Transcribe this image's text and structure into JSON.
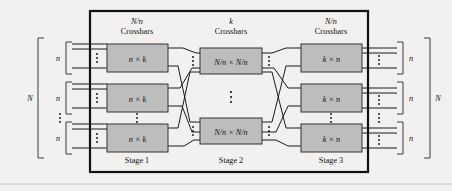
{
  "figure": {
    "background_color": "#f2f1ef",
    "crossbar_fill": "#bdbdbd",
    "line_color": "#1b1b1b"
  },
  "headers": [
    {
      "count_label": "N/n",
      "kind_label": "Crossbars",
      "x": 137
    },
    {
      "count_label": "k",
      "kind_label": "Crossbars",
      "x": 231
    },
    {
      "count_label": "N/n",
      "kind_label": "Crossbars",
      "x": 331
    }
  ],
  "stages": [
    {
      "name": "Stage 1",
      "label_x": 137,
      "box_label": "n × k",
      "boxes": [
        {
          "x": 107,
          "y": 44,
          "w": 61,
          "h": 28,
          "label": "n × k"
        },
        {
          "x": 107,
          "y": 84,
          "w": 61,
          "h": 28,
          "label": "n × k"
        },
        {
          "x": 107,
          "y": 124,
          "w": 61,
          "h": 28,
          "label": "n × k"
        }
      ],
      "vertical_ellipsis": [
        {
          "x": 137,
          "y": 114
        }
      ]
    },
    {
      "name": "Stage 2",
      "label_x": 231,
      "box_label": "N/n × N/n",
      "boxes": [
        {
          "x": 200,
          "y": 48,
          "w": 62,
          "h": 26,
          "label": "N/n × N/n"
        },
        {
          "x": 200,
          "y": 118,
          "w": 62,
          "h": 26,
          "label": "N/n × N/n"
        }
      ],
      "vertical_ellipsis": [
        {
          "x": 231,
          "y": 96
        }
      ]
    },
    {
      "name": "Stage 3",
      "label_x": 331,
      "box_label": "k × n",
      "boxes": [
        {
          "x": 301,
          "y": 44,
          "w": 61,
          "h": 28,
          "label": "k × n"
        },
        {
          "x": 301,
          "y": 84,
          "w": 61,
          "h": 28,
          "label": "k × n"
        },
        {
          "x": 301,
          "y": 124,
          "w": 61,
          "h": 28,
          "label": "k × n"
        }
      ],
      "vertical_ellipsis": [
        {
          "x": 331,
          "y": 114
        }
      ]
    }
  ],
  "left_brackets": {
    "outer_label": "N",
    "group_label": "n",
    "groups": [
      {
        "label": "n",
        "y_top": 42,
        "y_bottom": 74
      },
      {
        "label": "n",
        "y_top": 82,
        "y_bottom": 114
      },
      {
        "label": "n",
        "y_top": 122,
        "y_bottom": 154
      }
    ],
    "between_groups_ellipsis": [
      {
        "x": 60,
        "y": 118
      }
    ]
  },
  "right_brackets": {
    "outer_label": "N",
    "group_label": "n",
    "groups": [
      {
        "label": "n",
        "y_top": 42,
        "y_bottom": 74
      },
      {
        "label": "n",
        "y_top": 82,
        "y_bottom": 114
      },
      {
        "label": "n",
        "y_top": 122,
        "y_bottom": 154
      }
    ],
    "between_groups_ellipsis": [
      {
        "x": 394,
        "y": 118
      }
    ]
  },
  "port_ellipses_left_of_boxes": [
    {
      "x": 97,
      "y": 58
    },
    {
      "x": 97,
      "y": 98
    },
    {
      "x": 97,
      "y": 138
    }
  ],
  "port_ellipses_stage2_in": [
    {
      "x": 193,
      "y": 61
    },
    {
      "x": 193,
      "y": 131
    }
  ],
  "port_ellipses_stage2_out": [
    {
      "x": 269,
      "y": 61
    },
    {
      "x": 269,
      "y": 131
    }
  ],
  "port_ellipses_right_of_boxes": [
    {
      "x": 373,
      "y": 58
    },
    {
      "x": 373,
      "y": 98
    },
    {
      "x": 373,
      "y": 138
    }
  ],
  "frame": {
    "x": 90,
    "y": 11,
    "w": 278,
    "h": 161
  }
}
